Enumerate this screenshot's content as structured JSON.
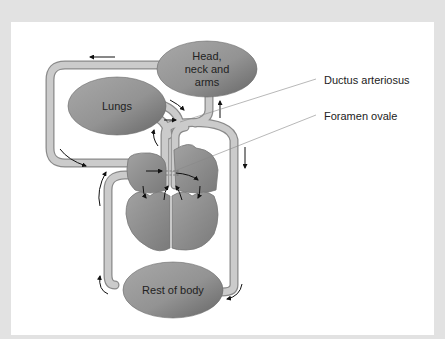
{
  "diagram": {
    "type": "fetal-circulation",
    "organs": {
      "head": {
        "lines": [
          "Head,",
          "neck and",
          "arms"
        ]
      },
      "lungs": {
        "label": "Lungs"
      },
      "body": {
        "label": "Rest of body"
      }
    },
    "callouts": [
      {
        "label": "Ductus arteriosus"
      },
      {
        "label": "Foramen ovale"
      }
    ],
    "colors": {
      "background": "#e2e2e2",
      "panel": "#ffffff",
      "organ_light": "#a4a4a4",
      "organ_dark": "#6e6e6e",
      "vessel_fill": "#c9c9c9",
      "vessel_stroke": "#8a8a8a",
      "arrow": "#111111",
      "callout_line": "#888888"
    }
  }
}
